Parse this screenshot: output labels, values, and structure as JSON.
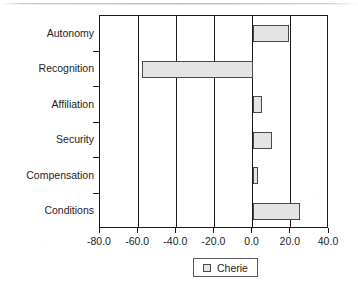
{
  "chart_data": {
    "type": "bar",
    "orientation": "horizontal",
    "title": "",
    "xlabel": "",
    "ylabel": "",
    "categories": [
      "Autonomy",
      "Recognition",
      "Affiliation",
      "Security",
      "Compensation",
      "Conditions"
    ],
    "series": [
      {
        "name": "Cherie",
        "values": [
          19,
          -58,
          5,
          10,
          3,
          25
        ],
        "fill_color": "#e4e4e4",
        "border_color": "#4a4a4a"
      }
    ],
    "xlim": [
      -80,
      40
    ],
    "xticks": [
      -80,
      -60,
      -40,
      -20,
      0,
      20,
      40
    ],
    "xtick_labels": [
      "-80.0",
      "-60.0",
      "-40.0",
      "-20.0",
      "0.0",
      "20.0",
      "40.0"
    ],
    "grid": true,
    "grid_axis": "x",
    "legend": {
      "position": "bottom",
      "entries": [
        "Cherie"
      ],
      "boxed": true
    },
    "axis_color": "#1a1a1a",
    "background": "#ffffff"
  }
}
